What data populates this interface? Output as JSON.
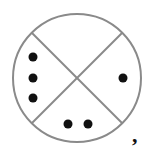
{
  "diagram": {
    "shape": "circle divided into four sectors by two diagonals",
    "colors": {
      "stroke": "#8a8a8a",
      "dot": "#111111"
    },
    "sectors": [
      {
        "position": "top",
        "dots": 0
      },
      {
        "position": "right",
        "dots": 1
      },
      {
        "position": "bottom",
        "dots": 2
      },
      {
        "position": "left",
        "dots": 3
      }
    ],
    "trailing_text": ","
  }
}
